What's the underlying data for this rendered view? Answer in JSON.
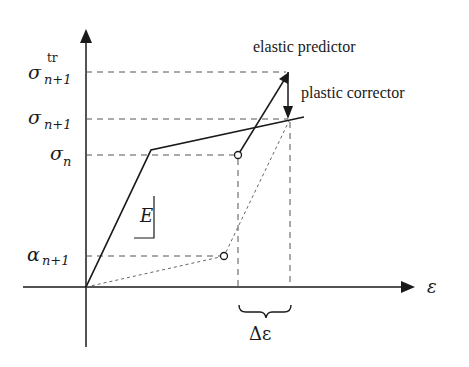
{
  "diagram": {
    "type": "return-mapping stress-strain diagram",
    "axes": {
      "x_label": "ε",
      "y_label": ""
    },
    "y_levels": [
      {
        "id": "sigma_tr",
        "base": "σ",
        "sub": "n+1",
        "sup": "tr"
      },
      {
        "id": "sigma_n1",
        "base": "σ",
        "sub": "n+1",
        "sup": ""
      },
      {
        "id": "sigma_n",
        "base": "σ",
        "sub": "n",
        "sup": ""
      },
      {
        "id": "alpha_n1",
        "base": "α",
        "sub": "n+1",
        "sup": ""
      }
    ],
    "annotations": {
      "elastic_predictor": "elastic predictor",
      "plastic_corrector": "plastic corrector",
      "modulus": "E",
      "strain_increment": "Δε"
    },
    "colors": {
      "line": "#1a1a1a",
      "dashed": "#555555",
      "background": "#ffffff"
    }
  }
}
